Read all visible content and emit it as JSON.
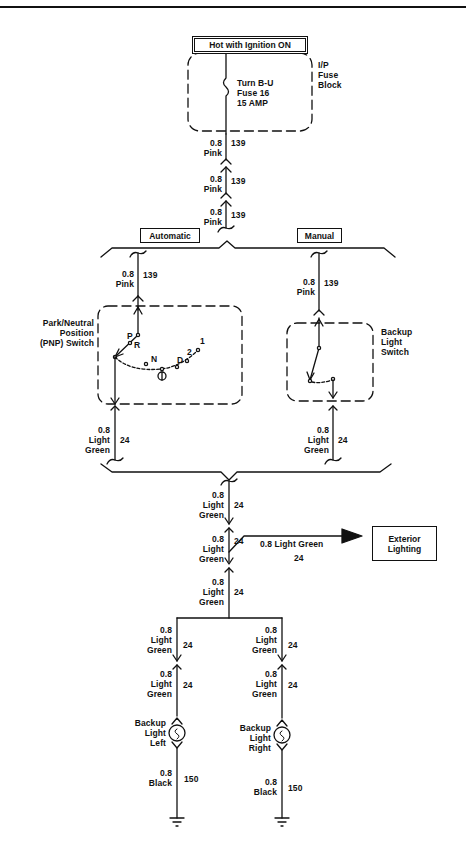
{
  "title_box": "Hot with Ignition ON",
  "fuse_block": {
    "label": "I/P\nFuse\nBlock",
    "fuse_text": "Turn B-U\nFuse 16\n15 AMP"
  },
  "wires_top": [
    {
      "gauge_color": "0.8\nPink",
      "circuit": "139"
    },
    {
      "gauge_color": "0.8\nPink",
      "circuit": "139"
    },
    {
      "gauge_color": "0.8\nPink",
      "circuit": "139"
    }
  ],
  "branches": {
    "automatic": {
      "label": "Automatic",
      "wire_in": {
        "gauge_color": "0.8\nPink",
        "circuit": "139"
      },
      "switch_label": "Park/Neutral\nPosition\n(PNP) Switch",
      "positions": [
        "P",
        "R",
        "N",
        "D",
        "2",
        "1"
      ],
      "wire_out": {
        "gauge_color": "0.8\nLight\nGreen",
        "circuit": "24"
      }
    },
    "manual": {
      "label": "Manual",
      "wire_in": {
        "gauge_color": "0.8\nPink",
        "circuit": "139"
      },
      "switch_label": "Backup\nLight\nSwitch",
      "wire_out": {
        "gauge_color": "0.8\nLight\nGreen",
        "circuit": "24"
      }
    }
  },
  "wires_mid": [
    {
      "gauge_color": "0.8\nLight\nGreen",
      "circuit": "24"
    },
    {
      "gauge_color": "0.8\nLight\nGreen",
      "circuit": "24"
    },
    {
      "gauge_color": "0.8\nLight\nGreen",
      "circuit": "24"
    }
  ],
  "exterior": {
    "wire_label": "0.8 Light Green",
    "circuit": "24",
    "box_label": "Exterior\nLighting"
  },
  "lamps": {
    "left": {
      "wire_a": {
        "gauge_color": "0.8\nLight\nGreen",
        "circuit": "24"
      },
      "wire_b": {
        "gauge_color": "0.8\nLight\nGreen",
        "circuit": "24"
      },
      "label": "Backup\nLight\nLeft",
      "ground_wire": {
        "gauge_color": "0.8\nBlack",
        "circuit": "150"
      }
    },
    "right": {
      "wire_a": {
        "gauge_color": "0.8\nLight\nGreen",
        "circuit": "24"
      },
      "wire_b": {
        "gauge_color": "0.8\nLight\nGreen",
        "circuit": "24"
      },
      "label": "Backup\nLight\nRight",
      "ground_wire": {
        "gauge_color": "0.8\nBlack",
        "circuit": "150"
      }
    }
  },
  "colors": {
    "ink": "#111111",
    "background": "#ffffff"
  }
}
